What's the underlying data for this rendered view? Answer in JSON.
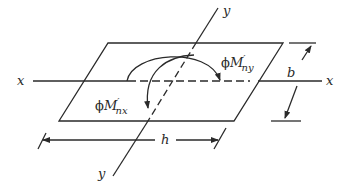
{
  "diagram": {
    "type": "biaxial bending of rectangular section (plan view)",
    "axes": {
      "x_left_label": "x",
      "x_right_label": "x",
      "y_top_label": "y",
      "y_bottom_label": "y"
    },
    "moments": {
      "about_y": {
        "phi": "ϕ",
        "symbol": "M",
        "prime": "′",
        "subscript": "ny"
      },
      "about_x": {
        "phi": "ϕ",
        "symbol": "M",
        "prime": "′",
        "subscript": "nx"
      }
    },
    "dimensions": {
      "width_label": "b",
      "depth_label": "h"
    },
    "colors": {
      "ink": "#2a2a2a",
      "background": "#ffffff"
    }
  }
}
